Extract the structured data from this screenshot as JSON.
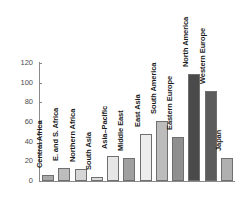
{
  "chart_data": {
    "type": "bar",
    "title": "",
    "subtitle": "",
    "xlabel": "",
    "ylabel": "",
    "ylim": [
      0,
      120
    ],
    "ytick_labels": [
      "0",
      "20",
      "40",
      "60",
      "80",
      "100",
      "120"
    ],
    "ytick_values": [
      0,
      20,
      40,
      60,
      80,
      100,
      120
    ],
    "grid": false,
    "legend": false,
    "categories": [
      "Central Africa",
      "E. and S. Africa",
      "Northern Africa",
      "South Asia",
      "Asia–Pacific",
      "Middle East",
      "East Asia",
      "South America",
      "Eastern Europe",
      "North America",
      "Western Europe",
      "Japan"
    ],
    "values": [
      6,
      13,
      12,
      4,
      25,
      23,
      48,
      61,
      45,
      109,
      92,
      23
    ],
    "bar_colors": [
      "#a9a9a9",
      "#bdbdbd",
      "#d6d6d6",
      "#dcdcdc",
      "#e6e6e6",
      "#a0a0a0",
      "#ededed",
      "#bcbcbc",
      "#8f8f8f",
      "#4a4a4a",
      "#5c5c5c",
      "#b0b0b0"
    ]
  },
  "colors": {
    "background": "#ffffff",
    "axis": "#8a8a8a",
    "tick_text": "#4d4d4d",
    "category_text": "#1a1a1a",
    "bar_border": "#6f6f6f"
  }
}
